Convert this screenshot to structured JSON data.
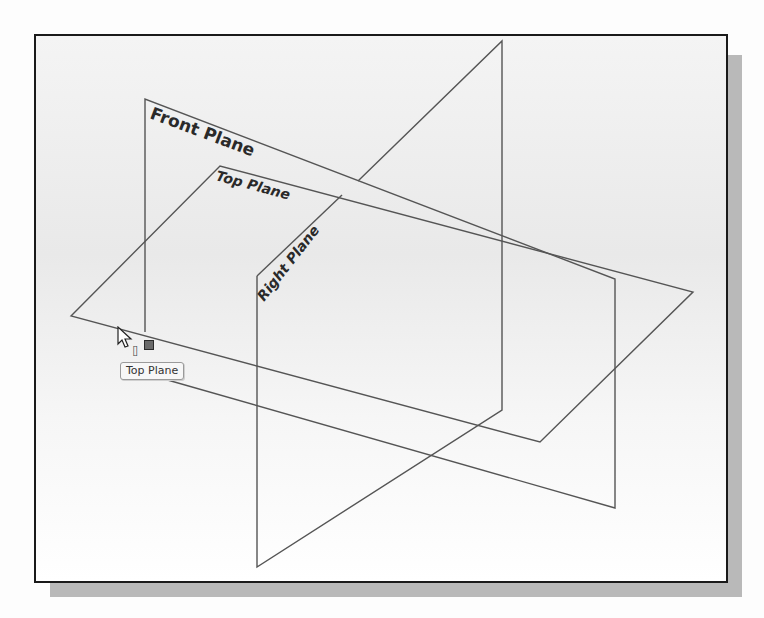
{
  "viewport": {
    "title": "3D Graphics Area",
    "background": "#f2f2f2",
    "frame_color": "#1a1a1a",
    "shadow_color": "#b9b9b9"
  },
  "planes": [
    {
      "name": "Front Plane",
      "label": "Front Plane",
      "points": "145,99 615,279 615,508 145,332"
    },
    {
      "name": "Top Plane",
      "label": "Top Plane",
      "points": "71,316 220,166 693,292 540,442"
    },
    {
      "name": "Right Plane",
      "label": "Right Plane",
      "points": "257,276 502,41 502,410 257,567"
    }
  ],
  "tooltip": {
    "text": "Top Plane"
  },
  "cursor": {
    "icon": "arrow-pointer-icon",
    "select_icon": "plane-select-icon"
  },
  "colors": {
    "edge": "#555555",
    "label": "#2a2a2a"
  }
}
